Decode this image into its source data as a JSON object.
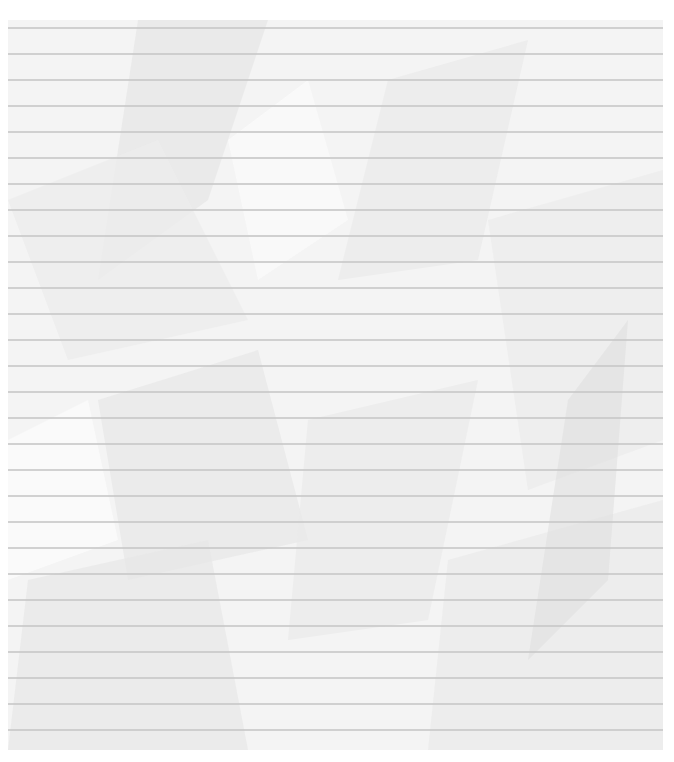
{
  "image": {
    "subject": "crumpled lined notebook paper",
    "paper_color": "#f4f4f4",
    "line_color": "#c9c9c9",
    "line_count": 28,
    "line_spacing_px": 26,
    "text_content": ""
  }
}
